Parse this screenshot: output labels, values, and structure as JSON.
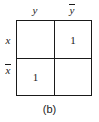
{
  "figure": {
    "caption": "(b)",
    "type": "karnaugh-map",
    "column_labels": [
      {
        "base": "y",
        "overbar": false,
        "text": "y"
      },
      {
        "base": "y",
        "overbar": true,
        "text": "ȳ"
      }
    ],
    "row_labels": [
      {
        "base": "x",
        "overbar": false,
        "text": "x"
      },
      {
        "base": "x",
        "overbar": true,
        "text": "x̄"
      }
    ],
    "cells": [
      {
        "row": 0,
        "col": 0,
        "value": ""
      },
      {
        "row": 0,
        "col": 1,
        "value": "1"
      },
      {
        "row": 1,
        "col": 0,
        "value": "1"
      },
      {
        "row": 1,
        "col": 1,
        "value": ""
      }
    ],
    "colors": {
      "ink": "#1a1a1a",
      "background": "#ffffff"
    }
  },
  "chart_data": {
    "type": "table",
    "title": "(b)",
    "xlabel": "y",
    "ylabel": "x",
    "categories": [
      "y",
      "ȳ"
    ],
    "row_categories": [
      "x",
      "x̄"
    ],
    "values": [
      [
        "",
        "1"
      ],
      [
        "1",
        ""
      ]
    ],
    "grid": true,
    "legend": "none"
  }
}
